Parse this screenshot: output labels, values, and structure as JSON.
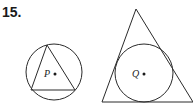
{
  "problem": {
    "number": "15."
  },
  "figures": [
    {
      "label": "P",
      "description": "triangle inscribed in circle",
      "circle": {
        "cx": 54,
        "cy": 72,
        "r": 28
      },
      "triangle": [
        [
          47,
          45
        ],
        [
          31,
          90
        ],
        [
          75,
          90
        ]
      ],
      "center_dot": [
        55,
        74
      ]
    },
    {
      "label": "Q",
      "description": "circle inscribed in triangle",
      "circle": {
        "cx": 144,
        "cy": 73,
        "r": 29
      },
      "triangle": [
        [
          136,
          9
        ],
        [
          102,
          102
        ],
        [
          193,
          102
        ]
      ],
      "center_dot": [
        144,
        74
      ]
    }
  ],
  "colors": {
    "stroke": "#2a2a2a",
    "text": "#1a1a1a"
  }
}
